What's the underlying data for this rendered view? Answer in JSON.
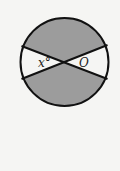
{
  "diagram": {
    "type": "geometry-circle-with-intersecting-chords",
    "labels": {
      "angle": "x°",
      "center": "O"
    },
    "colors": {
      "background": "#f5f5f3",
      "shaded": "#9c9c9c",
      "unshaded": "#f5f5f3",
      "stroke": "#111111"
    },
    "geometry": {
      "center": [
        64.5,
        62
      ],
      "radius": 44,
      "chord1": {
        "from": [
          21.5,
          46
        ],
        "to": [
          107.5,
          79
        ]
      },
      "chord2": {
        "from": [
          21.5,
          79
        ],
        "to": [
          107.5,
          45
        ]
      }
    },
    "shaded_regions": [
      "top-sector",
      "bottom-sector"
    ],
    "unshaded_regions": [
      "left-sector",
      "right-sector"
    ]
  }
}
